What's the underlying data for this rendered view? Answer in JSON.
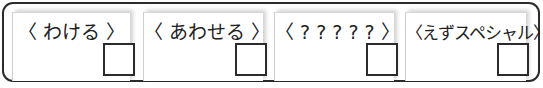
{
  "options": [
    {
      "label": "〈 わける 〉",
      "checked": false
    },
    {
      "label": "〈 あわせる 〉",
      "checked": false
    },
    {
      "label": "〈 ? ? ? ? ? 〉",
      "checked": false
    },
    {
      "label": "〈えずスペシャル〉",
      "checked": false
    }
  ],
  "colors": {
    "border": "#2b2b2b",
    "text": "#222222",
    "card_edge": "#cfcfcf"
  }
}
